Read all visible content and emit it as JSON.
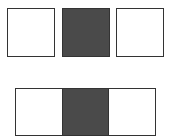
{
  "colors": {
    "stroke": "#333333",
    "light": "#ffffff",
    "dark": "#4a4a4a"
  },
  "top_row": {
    "boxes": [
      {
        "fill": "light"
      },
      {
        "fill": "dark"
      },
      {
        "fill": "light"
      }
    ]
  },
  "bottom_strip": {
    "cells": [
      {
        "fill": "light"
      },
      {
        "fill": "dark"
      },
      {
        "fill": "light"
      }
    ]
  }
}
